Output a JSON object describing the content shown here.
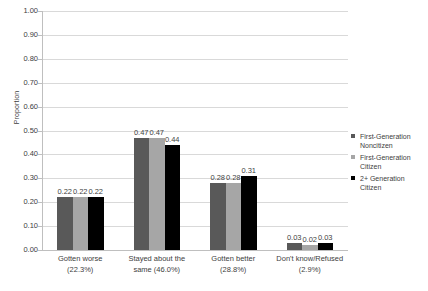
{
  "chart_data": {
    "type": "bar",
    "title": "",
    "xlabel": "",
    "ylabel": "Proportion",
    "ylim": [
      0,
      1.0
    ],
    "ytick_step": 0.1,
    "grid": true,
    "legend_position": "right",
    "categories": [
      "Gotten worse (22.3%)",
      "Stayed about the same (46.0%)",
      "Gotten better (28.8%)",
      "Don't know/Refused (2.9%)"
    ],
    "category_lines": [
      [
        "Gotten worse",
        "(22.3%)"
      ],
      [
        "Stayed about the",
        "same (46.0%)"
      ],
      [
        "Gotten better",
        "(28.8%)"
      ],
      [
        "Don't know/Refused",
        "(2.9%)"
      ]
    ],
    "series": [
      {
        "name": "First-Generation Noncitizen",
        "color": "#595959",
        "values": [
          0.22,
          0.47,
          0.28,
          0.03
        ],
        "labels": [
          "0.22",
          "0.47",
          "0.28",
          "0.03"
        ]
      },
      {
        "name": "First-Generation Citizen",
        "color": "#a6a6a6",
        "values": [
          0.22,
          0.47,
          0.28,
          0.02
        ],
        "labels": [
          "0.22",
          "0.47",
          "0.28",
          "0.02"
        ]
      },
      {
        "name": "2+ Generation Citizen",
        "color": "#000000",
        "values": [
          0.22,
          0.44,
          0.31,
          0.03
        ],
        "labels": [
          "0.22",
          "0.44",
          "0.31",
          "0.03"
        ]
      }
    ],
    "ytick_labels": [
      "1.00",
      "0.90",
      "0.80",
      "0.70",
      "0.60",
      "0.50",
      "0.40",
      "0.30",
      "0.20",
      "0.10",
      "0.00"
    ],
    "ytick_values": [
      1.0,
      0.9,
      0.8,
      0.7,
      0.6,
      0.5,
      0.4,
      0.3,
      0.2,
      0.1,
      0.0
    ]
  },
  "legend": {
    "items": [
      {
        "line1": "First-Generation",
        "line2": "Noncitizen",
        "color": "#595959"
      },
      {
        "line1": "First-Generation",
        "line2": "Citizen",
        "color": "#a6a6a6"
      },
      {
        "line1": "2+ Generation",
        "line2": "Citizen",
        "color": "#000000"
      }
    ]
  },
  "axis": {
    "y_title": "Proportion"
  }
}
